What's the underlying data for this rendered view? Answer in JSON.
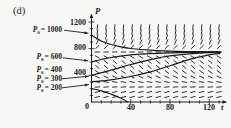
{
  "figure_label": "(d)",
  "chart_data": {
    "type": "line",
    "xlabel": "t",
    "ylabel": "P",
    "xlim": [
      0,
      131
    ],
    "ylim": [
      0,
      1260
    ],
    "grid": false,
    "x_ticks": [
      40,
      80,
      120
    ],
    "x_tick_labels": [
      "40",
      "80",
      "120"
    ],
    "x_minor_step": 10,
    "y_ticks": [
      400,
      800,
      1200
    ],
    "y_tick_labels": [
      "1200",
      "800",
      "400"
    ],
    "y_minor_step": 100,
    "origin_label": "0",
    "equilibrium": 750,
    "threshold": 250,
    "slope_field": {
      "ode": "dP/dt = P (P/250 - 1)(1 - P/750)",
      "threshold": 250,
      "carrying_capacity": 750,
      "t_start": 6,
      "t_end": 130,
      "cols": 15,
      "p_start": 75,
      "p_end": 1125,
      "rows": 15
    },
    "series": [
      {
        "name": "P0 = 1000",
        "p0": 1000,
        "points": [
          [
            0,
            1000
          ],
          [
            10,
            915
          ],
          [
            20,
            863
          ],
          [
            30,
            826
          ],
          [
            40,
            803
          ],
          [
            60,
            778
          ],
          [
            80,
            764
          ],
          [
            100,
            756
          ],
          [
            120,
            752
          ],
          [
            131,
            751
          ]
        ]
      },
      {
        "name": "P0 = 600",
        "p0": 600,
        "points": [
          [
            0,
            600
          ],
          [
            10,
            638
          ],
          [
            20,
            668
          ],
          [
            40,
            706
          ],
          [
            60,
            726
          ],
          [
            80,
            738
          ],
          [
            100,
            744
          ],
          [
            120,
            748
          ],
          [
            131,
            749
          ]
        ]
      },
      {
        "name": "P0 = 400",
        "p0": 400,
        "points": [
          [
            0,
            400
          ],
          [
            20,
            478
          ],
          [
            40,
            562
          ],
          [
            60,
            636
          ],
          [
            80,
            692
          ],
          [
            100,
            723
          ],
          [
            120,
            740
          ],
          [
            131,
            744
          ]
        ]
      },
      {
        "name": "P0 = 300",
        "p0": 300,
        "points": [
          [
            0,
            300
          ],
          [
            20,
            332
          ],
          [
            40,
            382
          ],
          [
            60,
            452
          ],
          [
            80,
            544
          ],
          [
            100,
            640
          ],
          [
            120,
            708
          ],
          [
            131,
            728
          ]
        ]
      },
      {
        "name": "P0 = 200",
        "p0": 200,
        "points": [
          [
            0,
            200
          ],
          [
            10,
            168
          ],
          [
            20,
            118
          ],
          [
            30,
            57
          ],
          [
            37,
            0
          ]
        ]
      }
    ],
    "ic_labels": [
      {
        "sym": "P",
        "sub": "0",
        "rest": "= 1000"
      },
      {
        "sym": "P",
        "sub": "0",
        "rest": "= 600"
      },
      {
        "sym": "P",
        "sub": "0",
        "rest": "= 400"
      },
      {
        "sym": "P",
        "sub": "0",
        "rest": "= 300"
      },
      {
        "sym": "P",
        "sub": "0",
        "rest": "= 200"
      }
    ],
    "ink_color": "#1b1b1b"
  }
}
